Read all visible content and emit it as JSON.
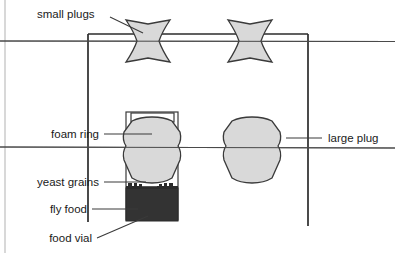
{
  "figure": {
    "background_color": "#ffffff",
    "outline_color": "#3a3a3a",
    "plug_fill": "#d9d9d9",
    "food_fill": "#333333",
    "frame_color": "#2b2b2b",
    "edge_tint": "#cfcfcf"
  },
  "labels": {
    "small_plugs": "small plugs",
    "foam_ring": "foam ring",
    "yeast_grains": "yeast grains",
    "fly_food": "fly food",
    "food_vial": "food vial",
    "large_plug": "large plug"
  },
  "parts": {
    "small_plug_left": "small-plug",
    "small_plug_right": "small-plug",
    "large_plug_left": "large-plug",
    "large_plug_right": "large-plug",
    "foam_ring_part": "foam-ring",
    "yeast_grain_specks": "yeast-grains",
    "fly_food_block": "fly-food",
    "food_vial_body": "food-vial",
    "rack_frame": "rack-frame",
    "shelf_line_top": "shelf-line",
    "shelf_line_bottom": "shelf-line"
  }
}
